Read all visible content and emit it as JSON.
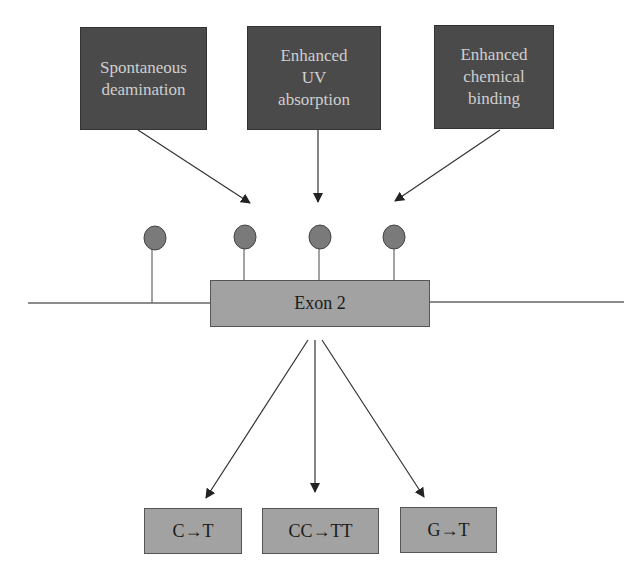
{
  "causes": [
    {
      "label": "Spontaneous\ndeamination"
    },
    {
      "label": "Enhanced\nUV\nabsorption"
    },
    {
      "label": "Enhanced\nchemical\nbinding"
    }
  ],
  "gene": {
    "exon_label": "Exon 2",
    "methylation_sites": 4
  },
  "outcomes": [
    {
      "label": "C→T"
    },
    {
      "label": "CC→TT"
    },
    {
      "label": "G→T"
    }
  ],
  "colors": {
    "cause_fill": "#4a4a4a",
    "cause_text": "#cfcfcf",
    "exon_fill": "#a2a2a2",
    "site_fill": "#7a7a7a",
    "line": "#555555"
  }
}
